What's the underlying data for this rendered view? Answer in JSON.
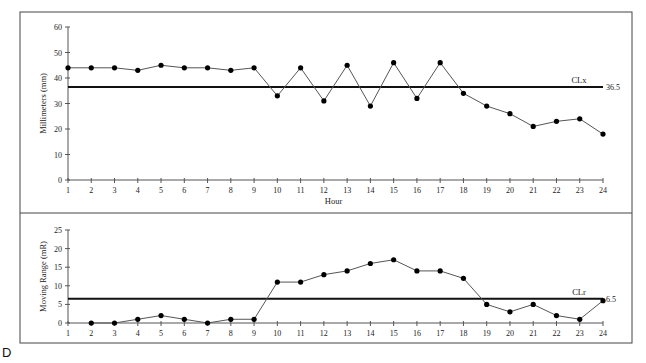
{
  "panel_label": "D",
  "chart_data": [
    {
      "type": "line",
      "title": "",
      "xlabel": "Hour",
      "ylabel": "Millimeters (mm)",
      "ylim": [
        0,
        60
      ],
      "yticks": [
        0,
        10,
        20,
        30,
        40,
        50,
        60
      ],
      "x": [
        1,
        2,
        3,
        4,
        5,
        6,
        7,
        8,
        9,
        10,
        11,
        12,
        13,
        14,
        15,
        16,
        17,
        18,
        19,
        20,
        21,
        22,
        23,
        24
      ],
      "values": [
        44,
        44,
        44,
        43,
        45,
        44,
        44,
        43,
        44,
        33,
        44,
        31,
        45,
        29,
        46,
        32,
        46,
        34,
        29,
        26,
        21,
        23,
        24,
        18
      ],
      "center_line": {
        "label": "CLx",
        "value": 36.5,
        "value_label": "36.5"
      },
      "grid": false,
      "legend": null
    },
    {
      "type": "line",
      "title": "",
      "xlabel": "",
      "ylabel": "Moving Range (mR)",
      "ylim": [
        0,
        25
      ],
      "yticks": [
        0,
        5,
        10,
        15,
        20,
        25
      ],
      "x": [
        2,
        3,
        4,
        5,
        6,
        7,
        8,
        9,
        10,
        11,
        12,
        13,
        14,
        15,
        16,
        17,
        18,
        19,
        20,
        21,
        22,
        23,
        24
      ],
      "xticks": [
        1,
        2,
        3,
        4,
        5,
        6,
        7,
        8,
        9,
        10,
        11,
        12,
        13,
        14,
        15,
        16,
        17,
        18,
        19,
        20,
        21,
        22,
        23,
        24
      ],
      "values": [
        0,
        0,
        1,
        2,
        1,
        0,
        1,
        1,
        11,
        11,
        13,
        14,
        16,
        17,
        14,
        14,
        12,
        5,
        3,
        5,
        2,
        1,
        6
      ],
      "center_line": {
        "label": "CLr",
        "value": 6.5,
        "value_label": "6.5"
      },
      "grid": false,
      "legend": null
    }
  ]
}
